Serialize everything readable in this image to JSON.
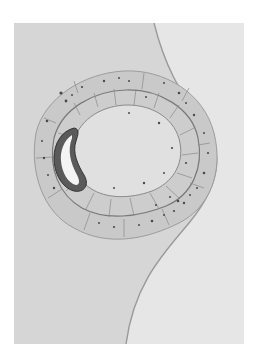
{
  "image": {
    "subject": "histological illustration of a ring-shaped cell layer surrounding a lumen with a curled embryo",
    "palette": {
      "page": "#ffffff",
      "plate_background": "#d8d8d8",
      "right_tissue": "#e8e8e8",
      "ring_fill": "#c7c7c7",
      "ring_outer_band": "#cfcfcf",
      "lumen": "#e2e2e2",
      "cell_lines": "#8a8a8a",
      "nuclei": "#4a4a4a",
      "embryo_dark": "#3c3c3c",
      "embryo_light": "#f4f4f4"
    }
  }
}
